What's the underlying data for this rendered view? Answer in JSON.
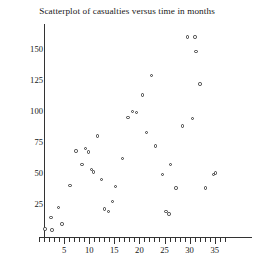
{
  "chart": {
    "title": "Scatterplot of casualties versus time in months",
    "xlabel": "",
    "ylabel": ""
  },
  "axes": {
    "y_tick_labels": [
      "25",
      "50",
      "75",
      "100",
      "125",
      "150"
    ],
    "x_tick_labels": [
      "5",
      "10",
      "15",
      "20",
      "25",
      "30",
      "35"
    ]
  },
  "chart_data": {
    "type": "scatter",
    "title": "Scatterplot of casualties versus time in months",
    "xlabel": "time in months",
    "ylabel": "casualties",
    "xlim": [
      0,
      37
    ],
    "ylim": [
      0,
      165
    ],
    "x_ticks": [
      5,
      10,
      15,
      20,
      25,
      30,
      35
    ],
    "y_ticks": [
      25,
      50,
      75,
      100,
      125,
      150
    ],
    "x_minor_tick_step": 1,
    "y_minor_tick_step": 5,
    "grid": false,
    "legend": false,
    "marker": "open-circle",
    "marker_color": "#3a3a3a",
    "points": [
      {
        "x": 1.2,
        "y": 5
      },
      {
        "x": 2.4,
        "y": 14
      },
      {
        "x": 2.6,
        "y": 4
      },
      {
        "x": 3.9,
        "y": 22
      },
      {
        "x": 4.6,
        "y": 9
      },
      {
        "x": 6.2,
        "y": 40
      },
      {
        "x": 7.4,
        "y": 68
      },
      {
        "x": 8.6,
        "y": 57
      },
      {
        "x": 9.3,
        "y": 70
      },
      {
        "x": 9.9,
        "y": 67
      },
      {
        "x": 10.4,
        "y": 53
      },
      {
        "x": 10.8,
        "y": 51
      },
      {
        "x": 11.6,
        "y": 80
      },
      {
        "x": 12.5,
        "y": 45
      },
      {
        "x": 13.1,
        "y": 21
      },
      {
        "x": 13.9,
        "y": 19
      },
      {
        "x": 14.6,
        "y": 27
      },
      {
        "x": 15.2,
        "y": 39
      },
      {
        "x": 16.6,
        "y": 62
      },
      {
        "x": 17.7,
        "y": 95
      },
      {
        "x": 18.6,
        "y": 100
      },
      {
        "x": 19.4,
        "y": 99
      },
      {
        "x": 20.6,
        "y": 113
      },
      {
        "x": 21.4,
        "y": 83
      },
      {
        "x": 22.4,
        "y": 129
      },
      {
        "x": 23.2,
        "y": 72
      },
      {
        "x": 24.6,
        "y": 49
      },
      {
        "x": 25.3,
        "y": 19
      },
      {
        "x": 25.9,
        "y": 17
      },
      {
        "x": 26.2,
        "y": 57
      },
      {
        "x": 27.3,
        "y": 38
      },
      {
        "x": 28.6,
        "y": 88
      },
      {
        "x": 29.6,
        "y": 160
      },
      {
        "x": 30.6,
        "y": 94
      },
      {
        "x": 31.1,
        "y": 160
      },
      {
        "x": 31.3,
        "y": 148
      },
      {
        "x": 32.1,
        "y": 122
      },
      {
        "x": 33.2,
        "y": 38
      },
      {
        "x": 34.8,
        "y": 49
      },
      {
        "x": 35.1,
        "y": 50
      }
    ]
  }
}
